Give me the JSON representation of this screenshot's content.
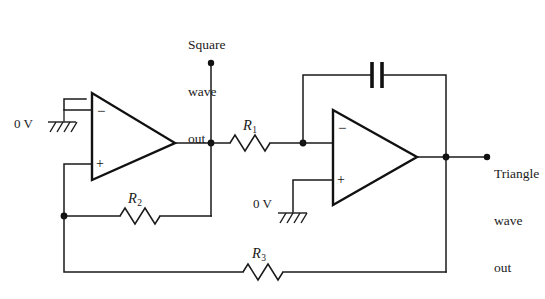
{
  "diagram": {
    "background_color": "#ffffff",
    "line_color": "#1a1a1a"
  },
  "labels": {
    "square_out_line1": "Square",
    "square_out_line2": "wave",
    "square_out_line3": "out",
    "triangle_out_line1": "Triangle",
    "triangle_out_line2": "wave",
    "triangle_out_line3": "out",
    "ground_left": "0 V",
    "ground_right": "0 V"
  },
  "components": {
    "r1_label": "R",
    "r1_sub": "1",
    "r2_label": "R",
    "r2_sub": "2",
    "r3_label": "R",
    "r3_sub": "3",
    "opamp1_inverting": "−",
    "opamp1_noninverting": "+",
    "opamp2_inverting": "−",
    "opamp2_noninverting": "+"
  }
}
